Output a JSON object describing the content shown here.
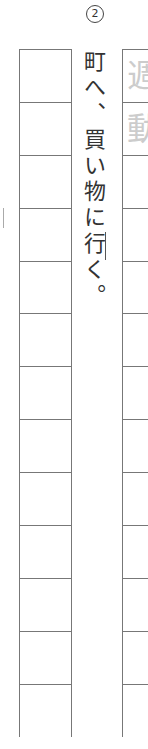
{
  "problem": {
    "number": "2",
    "sentence": "町へ、買い物に行く。"
  },
  "grid": {
    "rows": 13,
    "ghost_chars": [
      "週",
      "動"
    ]
  }
}
